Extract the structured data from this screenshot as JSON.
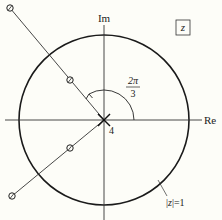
{
  "diagram": {
    "title_box": "z",
    "axes": {
      "x_label": "Re",
      "y_label": "Im"
    },
    "unit_circle_label": "|z|=1",
    "unit_circle_label_parts": [
      "|",
      "z",
      "|=1"
    ],
    "angle_label": {
      "numerator": "2π",
      "denominator": "3"
    },
    "pole_multiplicity": "4",
    "colors": {
      "stroke": "#1a1a1a",
      "background": "#fdfdf8"
    },
    "elements": {
      "pole": {
        "symbol": "×",
        "location": "origin",
        "order": 4
      },
      "zeros": [
        {
          "symbol": "o",
          "ray_angle": "2π/3",
          "position": "inside unit circle"
        },
        {
          "symbol": "o",
          "ray_angle": "2π/3",
          "position": "outside unit circle"
        },
        {
          "symbol": "o",
          "ray_angle": "-2π/3",
          "position": "inside unit circle"
        },
        {
          "symbol": "o",
          "ray_angle": "-2π/3",
          "position": "outside unit circle"
        }
      ]
    }
  }
}
